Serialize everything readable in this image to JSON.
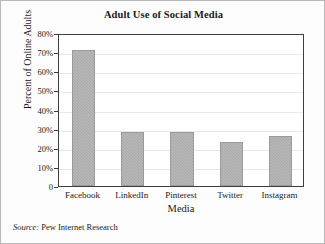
{
  "chart_data": {
    "type": "bar",
    "title": "Adult Use of Social Media",
    "xlabel": "Media",
    "ylabel": "Percent of Online Adults",
    "categories": [
      "Facebook",
      "LinkedIn",
      "Pinterest",
      "Twitter",
      "Instagram"
    ],
    "values": [
      71,
      28,
      28,
      23,
      26
    ],
    "ylim": [
      0,
      80
    ],
    "ytick_values": [
      0,
      10,
      20,
      30,
      40,
      50,
      60,
      70,
      80
    ],
    "ytick_labels": [
      "0",
      "10%",
      "20%",
      "30%",
      "40%",
      "50%",
      "60%",
      "70%",
      "80%"
    ],
    "grid": "horizontal",
    "legend": "none",
    "series": [
      {
        "name": "Percent of Online Adults",
        "values": [
          71,
          28,
          28,
          23,
          26
        ]
      }
    ],
    "bar_color": "#a9a9a9",
    "plot_border_color": "#3d3d3d",
    "gridline_color": "#e9e9e9"
  },
  "source": {
    "label": "Source:",
    "text": "Pew Internet Research"
  }
}
